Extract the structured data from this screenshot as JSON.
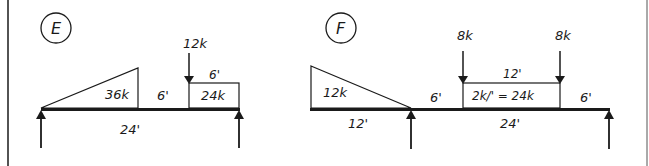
{
  "diagrams": [
    {
      "id": "E",
      "label": "E",
      "span_label": "24'",
      "distributed_triangle": {
        "resultant": "36k"
      },
      "gap_label": "6'",
      "point_load": {
        "label": "12k"
      },
      "uniform_block": {
        "length_label": "6'",
        "resultant": "24k"
      }
    },
    {
      "id": "F",
      "label": "F",
      "overhang_label": "12'",
      "overhang_triangle": {
        "resultant": "12k"
      },
      "span_label": "24'",
      "left_gap_label": "6'",
      "right_gap_label": "6'",
      "point_loads": [
        {
          "label": "8k"
        },
        {
          "label": "8k"
        }
      ],
      "uniform_block": {
        "length_label": "12'",
        "load_label": "2k/' = 24k"
      }
    }
  ],
  "colors": {
    "ink": "#1a1a1a",
    "background": "#ffffff"
  }
}
